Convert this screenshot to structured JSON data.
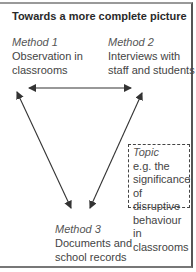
{
  "title": "Towards a more complete picture",
  "nodes": {
    "method1": {
      "label": "Method 1",
      "text_line1": "Observation in",
      "text_line2": "classrooms"
    },
    "method2": {
      "label": "Method 2",
      "text_line1": "Interviews with",
      "text_line2": "staff and students"
    },
    "method3": {
      "label": "Method 3",
      "text_line1": "Documents and",
      "text_line2": "school records"
    }
  },
  "topic": {
    "label": "Topic",
    "lines": [
      "e.g. the",
      "significance",
      "of disruptive",
      "behaviour in",
      "classrooms"
    ]
  },
  "arrows": [
    {
      "from": "method1",
      "to": "method2",
      "type": "bidirectional"
    },
    {
      "from": "method3",
      "to": "method1",
      "type": "bidirectional"
    },
    {
      "from": "method3",
      "to": "method2",
      "type": "bidirectional"
    }
  ],
  "colors": {
    "line": "#333333",
    "text": "#444444"
  }
}
